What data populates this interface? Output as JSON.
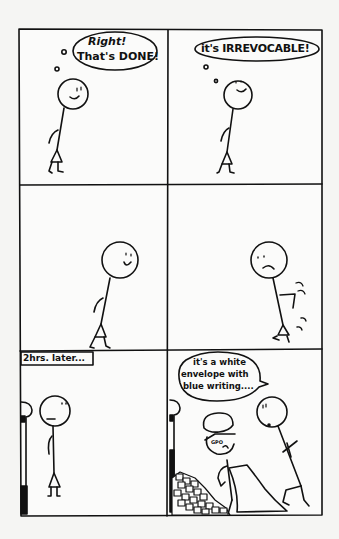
{
  "comic": {
    "layout": {
      "rows": 3,
      "columns": 2
    },
    "colors": {
      "ink": "#111111",
      "paper": "#f5f5f3",
      "panel_bg": "#fbfbfa"
    },
    "panels": [
      {
        "index": 1,
        "description": "Stick figure walking away from a mailbox, smiling",
        "thought_bubble": {
          "line1": "Right!",
          "line2": "That's DONE!"
        }
      },
      {
        "index": 2,
        "description": "Stick figure continues walking, smiling",
        "thought_bubble": {
          "line1": "it's IRREVOCABLE!"
        }
      },
      {
        "index": 3,
        "description": "Stick figure walking, smiling"
      },
      {
        "index": 4,
        "description": "Stick figure stops, frowning, turns back with motion lines"
      },
      {
        "index": 5,
        "caption": "2hrs. later...",
        "description": "Stick figure standing blankly next to a mailbox"
      },
      {
        "index": 6,
        "description": "Postal worker in cap emptying mailbox; pile of letters; stick figure crouched beside",
        "speech_bubble": {
          "line1": "it's a white",
          "line2": "envelope with",
          "line3": "blue writing...."
        },
        "cap_label": "GPO"
      }
    ]
  }
}
